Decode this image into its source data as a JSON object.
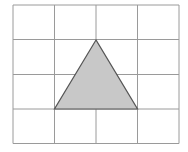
{
  "diagram": {
    "type": "grid-with-triangle",
    "grid": {
      "columns": 4,
      "rows": 4,
      "x_lines": [
        13,
        54.5,
        96,
        137.5,
        179
      ],
      "y_lines": [
        5,
        39.5,
        74.5,
        109,
        143.5
      ],
      "line_color": "#9a9a9a"
    },
    "triangle": {
      "vertices_grid": [
        [
          2,
          1
        ],
        [
          1,
          3
        ],
        [
          3,
          3
        ]
      ],
      "points": "96,40 54.5,109 137.5,109",
      "fill": "#c8c8c8",
      "stroke": "#555555"
    }
  }
}
